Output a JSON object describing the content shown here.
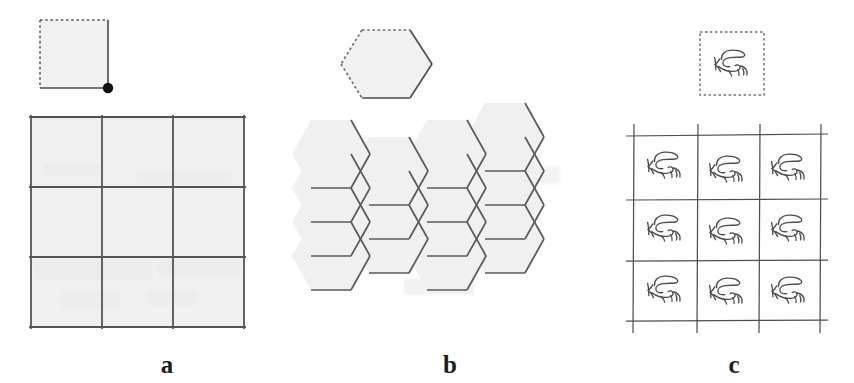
{
  "figure": {
    "background_color": "#ffffff",
    "tile_fill_color": "#f1f1f1",
    "tile_stroke_color": "#6b6b6b",
    "grid_stroke_color": "#555555",
    "motif_stroke_color": "#4a4a4a",
    "dot_color": "#111111",
    "bleed_through_color": "#eeeeee",
    "panels": [
      {
        "id": "a",
        "label": "a",
        "prototile": {
          "shape": "square",
          "name": "square-prototile",
          "dashed_edges": [
            "top",
            "left"
          ],
          "solid_edges": [
            "bottom",
            "right"
          ],
          "marker": "corner-dot-bottom-right"
        },
        "tiling": {
          "name": "square-grid-tiling",
          "rows": 3,
          "columns": 3,
          "cells": 9
        }
      },
      {
        "id": "b",
        "label": "b",
        "prototile": {
          "shape": "hexagon",
          "name": "hexagon-prototile",
          "dashed_edges": [
            "top",
            "upper-left",
            "lower-left"
          ],
          "solid_edges": [
            "upper-right",
            "lower-right",
            "bottom"
          ],
          "marker": "none"
        },
        "tiling": {
          "name": "hexagonal-honeycomb-tiling",
          "columns": 4,
          "cells": 11
        }
      },
      {
        "id": "c",
        "label": "c",
        "prototile": {
          "shape": "square-with-motif",
          "name": "motif-prototile",
          "dashed_edges": [
            "top",
            "left",
            "bottom",
            "right"
          ],
          "solid_edges": [],
          "marker": "squiggle-motif"
        },
        "tiling": {
          "name": "motif-grid-tiling",
          "rows": 3,
          "columns": 3,
          "cells": 9
        }
      }
    ]
  }
}
